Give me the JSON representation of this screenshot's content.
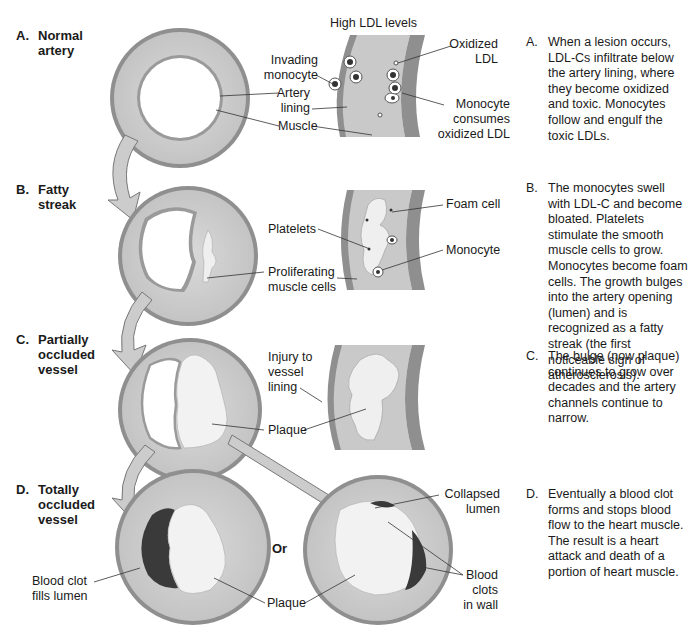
{
  "colors": {
    "outer_wall": "#8c8c8c",
    "muscle": "#cfcfcf",
    "lining": "#9a9a9a",
    "plaque": "#f2f2f2",
    "clot": "#3a3a3a",
    "arrow_fill": "#cccccc",
    "arrow_stroke": "#777777"
  },
  "stages": [
    {
      "letter": "A.",
      "name": "Normal\nartery",
      "inset_title": "High LDL levels",
      "labels": {
        "invading_monocyte": "Invading\nmonocyte",
        "artery_lining": "Artery\nlining",
        "muscle": "Muscle",
        "oxidized_ldl": "Oxidized\nLDL",
        "monocyte_consumes": "Monocyte\nconsumes\noxidized LDL"
      },
      "description_letter": "A.",
      "description": "When a lesion occurs, LDL-Cs infiltrate below the artery lining, where they become oxidized and toxic. Monocytes follow and engulf the toxic LDLs."
    },
    {
      "letter": "B.",
      "name": "Fatty\nstreak",
      "labels": {
        "platelets": "Platelets",
        "proliferating": "Proliferating\nmuscle cells",
        "foam_cell": "Foam cell",
        "monocyte": "Monocyte"
      },
      "description_letter": "B.",
      "description": "The monocytes swell with LDL-C and become bloated. Platelets stimulate the smooth muscle cells to grow. Monocytes become foam cells. The growth bulges into the artery opening (lumen) and is recognized as a fatty streak (the first noticeable sign of atherosclerosis)."
    },
    {
      "letter": "C.",
      "name": "Partially\noccluded\nvessel",
      "labels": {
        "injury": "Injury to\nvessel\nlining",
        "plaque": "Plaque"
      },
      "description_letter": "C.",
      "description": "The bulge (now plaque) continues to grow over decades and the artery channels continue to narrow."
    },
    {
      "letter": "D.",
      "name": "Totally\noccluded\nvessel",
      "labels": {
        "blood_clot_fills": "Blood clot\nfills lumen",
        "plaque": "Plaque",
        "or": "Or",
        "collapsed_lumen": "Collapsed\nlumen",
        "blood_clots_wall": "Blood\nclots\nin wall"
      },
      "description_letter": "D.",
      "description": "Eventually a blood clot forms and stops blood flow to the heart muscle. The result is a heart attack and death of a portion of heart muscle."
    }
  ]
}
